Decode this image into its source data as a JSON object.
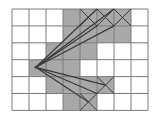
{
  "diagram": {
    "title": "",
    "grid": {
      "columns": 8,
      "rows": 6
    },
    "colors": {
      "background": "#ffffff",
      "grid_line": "#7a7a7a",
      "shaded_fill": "#a8a8a8",
      "line": "#3a3a3a"
    },
    "shaded_cells": [
      {
        "col": 3,
        "row": 0
      },
      {
        "col": 4,
        "row": 0
      },
      {
        "col": 5,
        "row": 0
      },
      {
        "col": 6,
        "row": 0
      },
      {
        "col": 3,
        "row": 1
      },
      {
        "col": 4,
        "row": 1
      },
      {
        "col": 5,
        "row": 1
      },
      {
        "col": 6,
        "row": 1
      },
      {
        "col": 2,
        "row": 2
      },
      {
        "col": 3,
        "row": 2
      },
      {
        "col": 4,
        "row": 2
      },
      {
        "col": 1,
        "row": 3
      },
      {
        "col": 2,
        "row": 3
      },
      {
        "col": 3,
        "row": 3
      },
      {
        "col": 2,
        "row": 4
      },
      {
        "col": 3,
        "row": 4
      },
      {
        "col": 4,
        "row": 4
      },
      {
        "col": 5,
        "row": 4
      },
      {
        "col": 3,
        "row": 5
      },
      {
        "col": 4,
        "row": 5
      }
    ],
    "crossed_cells": [
      {
        "col": 4,
        "row": 0
      },
      {
        "col": 5,
        "row": 0
      },
      {
        "col": 6,
        "row": 0
      },
      {
        "col": 5,
        "row": 4
      },
      {
        "col": 4,
        "row": 5
      }
    ],
    "origin": {
      "col": 1.4,
      "row": 3.45
    },
    "rays_to": [
      {
        "col": 5,
        "row": 0
      },
      {
        "col": 6,
        "row": 0
      },
      {
        "col": 5,
        "row": 1
      },
      {
        "col": 6,
        "row": 1
      },
      {
        "col": 5.5,
        "row": 4.5
      },
      {
        "col": 4.5,
        "row": 5.5
      },
      {
        "col": 5,
        "row": 5
      }
    ]
  }
}
